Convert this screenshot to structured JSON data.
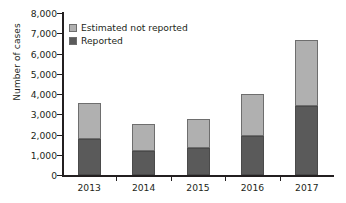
{
  "chart_data": {
    "type": "bar",
    "subtype": "stacked-vertical",
    "title": "",
    "subtitle": "",
    "xlabel": "",
    "ylabel": "Number of cases",
    "categories": [
      "2013",
      "2014",
      "2015",
      "2016",
      "2017"
    ],
    "series": [
      {
        "name": "Reported",
        "color": "#5a5a5a",
        "values": [
          1780,
          1190,
          1330,
          1930,
          3410
        ]
      },
      {
        "name": "Estimated not reported",
        "color": "#b0b0b0",
        "values": [
          1770,
          1330,
          1440,
          2070,
          3260
        ]
      }
    ],
    "totals": [
      3550,
      2520,
      2770,
      4000,
      6670
    ],
    "stack_order_bottom_to_top": [
      "Reported",
      "Estimated not reported"
    ],
    "ylim": [
      0,
      8000
    ],
    "ytick_values": [
      0,
      1000,
      2000,
      3000,
      4000,
      5000,
      6000,
      7000,
      8000
    ],
    "ytick_labels": [
      "0",
      "1,000",
      "2,000",
      "3,000",
      "4,000",
      "5,000",
      "6,000",
      "7,000",
      "8,000"
    ],
    "grid": false,
    "legend_position": "top-left",
    "legend_entries": [
      {
        "label": "Estimated not reported",
        "color": "#b0b0b0"
      },
      {
        "label": "Reported",
        "color": "#5a5a5a"
      }
    ],
    "annotations": []
  },
  "axes": {
    "y_title": "Number of cases",
    "y_ticks": [
      {
        "label": "8,000",
        "value": 8000
      },
      {
        "label": "7,000",
        "value": 7000
      },
      {
        "label": "6,000",
        "value": 6000
      },
      {
        "label": "5,000",
        "value": 5000
      },
      {
        "label": "4,000",
        "value": 4000
      },
      {
        "label": "3,000",
        "value": 3000
      },
      {
        "label": "2,000",
        "value": 2000
      },
      {
        "label": "1,000",
        "value": 1000
      },
      {
        "label": "0",
        "value": 0
      }
    ],
    "x_ticks": [
      {
        "label": "2013"
      },
      {
        "label": "2014"
      },
      {
        "label": "2015"
      },
      {
        "label": "2016"
      },
      {
        "label": "2017"
      }
    ]
  },
  "legend": {
    "items": [
      {
        "label": "Estimated not reported",
        "color": "#b0b0b0"
      },
      {
        "label": "Reported",
        "color": "#5a5a5a"
      }
    ]
  },
  "colors": {
    "estimated_not_reported": "#b0b0b0",
    "reported": "#5a5a5a",
    "axis": "#231f20",
    "background": "#ffffff",
    "bar_outline": "#6e6e6e"
  }
}
